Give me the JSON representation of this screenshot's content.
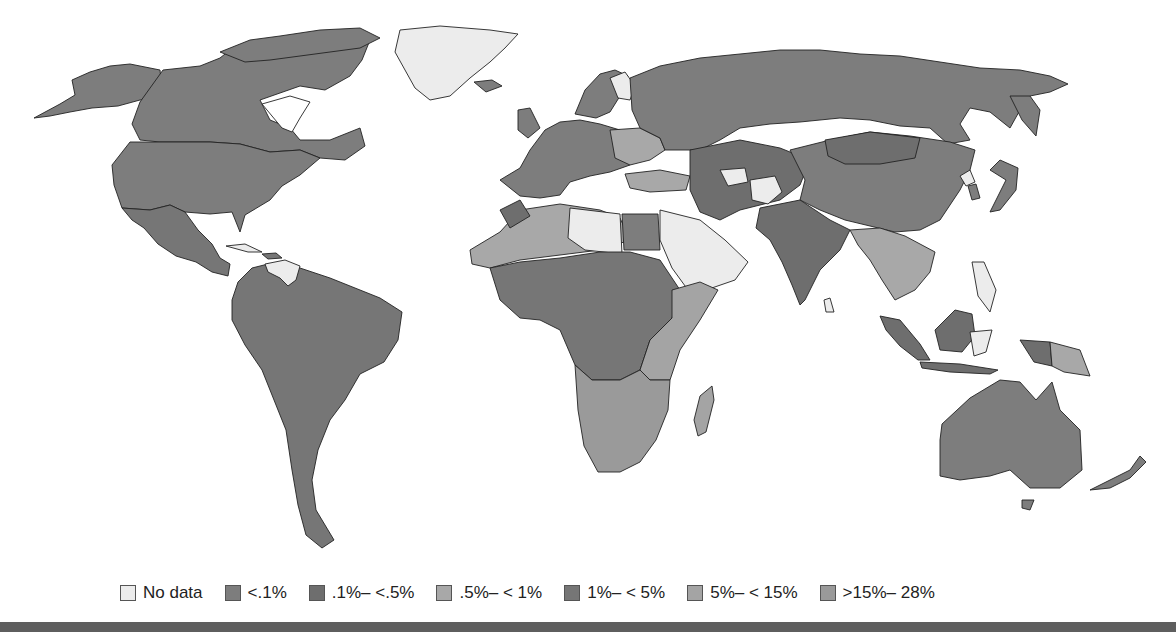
{
  "map": {
    "title": "",
    "type": "choropleth world map",
    "colors": {
      "no_data": "#ececec",
      "lt_0_1": "#7d7d7d",
      "0_1_to_0_5": "#6e6e6e",
      "0_5_to_1": "#a8a8a8",
      "1_to_5": "#767676",
      "5_to_15": "#a4a4a4",
      "15_to_28": "#9a9a9a",
      "stroke": "#222222",
      "background": "#ffffff"
    },
    "regions": {
      "north_america": "lt_0_1",
      "greenland": "no_data",
      "central_america": "1_to_5",
      "south_america": "1_to_5",
      "venezuela": "no_data",
      "europe_west": "lt_0_1",
      "europe_east": "0_5_to_1",
      "russia": "lt_0_1",
      "north_africa": "0_5_to_1",
      "libya": "no_data",
      "arabia": "no_data",
      "central_africa": "1_to_5",
      "east_africa": "5_to_15",
      "southern_africa": "15_to_28",
      "madagascar": "5_to_15",
      "central_asia": "0_1_to_0_5",
      "china": "lt_0_1",
      "india": "0_1_to_0_5",
      "southeast_asia": "0_5_to_1",
      "indonesia": "0_1_to_0_5",
      "australia": "lt_0_1",
      "new_zealand": "lt_0_1",
      "japan": "lt_0_1"
    }
  },
  "legend": {
    "items": [
      {
        "label": "No data",
        "color": "#ececec"
      },
      {
        "label": "<.1%",
        "color": "#7d7d7d"
      },
      {
        "label": ".1%– <.5%",
        "color": "#6e6e6e"
      },
      {
        "label": ".5%– < 1%",
        "color": "#a8a8a8"
      },
      {
        "label": "1%– < 5%",
        "color": "#767676"
      },
      {
        "label": "5%– < 15%",
        "color": "#a4a4a4"
      },
      {
        "label": ">15%– 28%",
        "color": "#9a9a9a"
      }
    ]
  }
}
